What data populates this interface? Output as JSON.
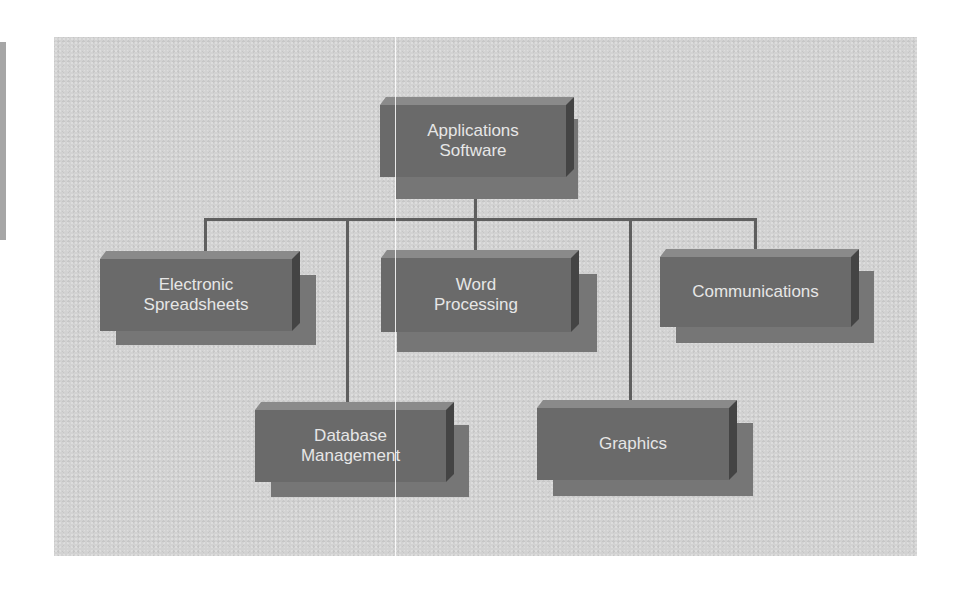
{
  "diagram": {
    "type": "hierarchy-chart",
    "colors": {
      "panel_background": "#d2d2d2",
      "box_face": "#6a6a6a",
      "box_top": "#8a8a8a",
      "box_side": "#444444",
      "box_shadow": "#767676",
      "box_text": "#e6e6e6",
      "connector": "#5f5f5f"
    },
    "root": {
      "line1": "Applications",
      "line2": "Software"
    },
    "children": [
      {
        "line1": "Electronic",
        "line2": "Spreadsheets"
      },
      {
        "line1": "Database",
        "line2": "Management"
      },
      {
        "line1": "Word",
        "line2": "Processing"
      },
      {
        "line1": "Graphics",
        "line2": ""
      },
      {
        "line1": "Communications",
        "line2": ""
      }
    ],
    "edges": [
      {
        "from": "Applications Software",
        "to": "Electronic Spreadsheets"
      },
      {
        "from": "Applications Software",
        "to": "Database Management"
      },
      {
        "from": "Applications Software",
        "to": "Word Processing"
      },
      {
        "from": "Applications Software",
        "to": "Graphics"
      },
      {
        "from": "Applications Software",
        "to": "Communications"
      }
    ]
  }
}
